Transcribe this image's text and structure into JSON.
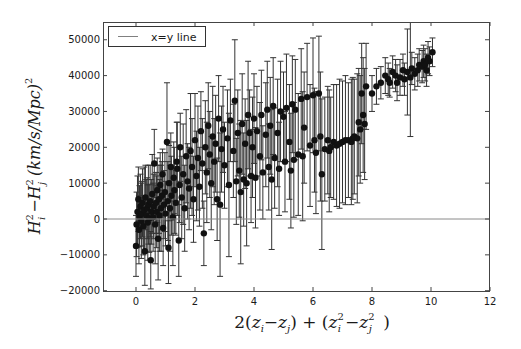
{
  "chart_data": {
    "type": "scatter",
    "title": "",
    "xlabel": "2(z_i - z_j) + (z_i^2 - z_j^2)",
    "ylabel": "H_i^2 - H_j^2 (km/s/Mpc)^2",
    "xlim": [
      -1.1,
      12
    ],
    "ylim": [
      -20000,
      55000
    ],
    "xticks": [
      0,
      2,
      4,
      6,
      8,
      10,
      12
    ],
    "yticks": [
      -20000,
      -10000,
      0,
      10000,
      20000,
      30000,
      40000,
      50000
    ],
    "xtick_labels": [
      "0",
      "2",
      "4",
      "6",
      "8",
      "10",
      "12"
    ],
    "ytick_labels": [
      "−20000",
      "−10000",
      "0",
      "10000",
      "20000",
      "30000",
      "40000",
      "50000"
    ],
    "grid": false,
    "legend": {
      "position": "upper left",
      "entries": [
        {
          "label": "x=y line",
          "style": "line",
          "color": "#808080"
        }
      ]
    },
    "reference_line": {
      "name": "x=y line",
      "y": 0,
      "color": "#8a8a8a"
    },
    "marker_color": "#111111",
    "errorbar_color": "#333333",
    "series": [
      {
        "name": "data",
        "points": [
          [
            0.0,
            -7500,
            8500
          ],
          [
            0.02,
            -1500,
            9000
          ],
          [
            0.05,
            2000,
            10000
          ],
          [
            0.08,
            5500,
            9000
          ],
          [
            0.1,
            -3000,
            9500
          ],
          [
            0.12,
            800,
            8500
          ],
          [
            0.15,
            3500,
            9000
          ],
          [
            0.18,
            -500,
            10500
          ],
          [
            0.2,
            1500,
            9000
          ],
          [
            0.22,
            4500,
            9500
          ],
          [
            0.25,
            -2000,
            8000
          ],
          [
            0.28,
            2500,
            12000
          ],
          [
            0.3,
            -9000,
            9500
          ],
          [
            0.32,
            6000,
            9000
          ],
          [
            0.35,
            1000,
            10000
          ],
          [
            0.38,
            3000,
            8500
          ],
          [
            0.4,
            -1000,
            10500
          ],
          [
            0.42,
            4000,
            11000
          ],
          [
            0.45,
            200,
            9500
          ],
          [
            0.48,
            5000,
            10000
          ],
          [
            0.5,
            -11500,
            8000
          ],
          [
            0.52,
            2000,
            9000
          ],
          [
            0.55,
            7000,
            11000
          ],
          [
            0.58,
            500,
            9500
          ],
          [
            0.6,
            3500,
            9000
          ],
          [
            0.62,
            15500,
            9500
          ],
          [
            0.65,
            -1500,
            11000
          ],
          [
            0.68,
            4500,
            8500
          ],
          [
            0.7,
            2000,
            10000
          ],
          [
            0.72,
            8000,
            9000
          ],
          [
            0.75,
            -5500,
            11500
          ],
          [
            0.78,
            5500,
            9500
          ],
          [
            0.8,
            1000,
            10000
          ],
          [
            0.82,
            9500,
            9000
          ],
          [
            0.85,
            3000,
            12000
          ],
          [
            0.88,
            6500,
            9500
          ],
          [
            0.9,
            12500,
            7000
          ],
          [
            0.92,
            -2500,
            10500
          ],
          [
            0.95,
            4000,
            9500
          ],
          [
            0.98,
            7500,
            11000
          ],
          [
            1.0,
            1500,
            9000
          ],
          [
            1.05,
            21500,
            16500
          ],
          [
            1.08,
            5000,
            11000
          ],
          [
            1.1,
            -8000,
            10000
          ],
          [
            1.12,
            10000,
            10500
          ],
          [
            1.15,
            3000,
            12000
          ],
          [
            1.18,
            14500,
            9500
          ],
          [
            1.2,
            6500,
            11000
          ],
          [
            1.25,
            500,
            13500
          ],
          [
            1.28,
            11500,
            10000
          ],
          [
            1.3,
            8000,
            12000
          ],
          [
            1.35,
            4500,
            9000
          ],
          [
            1.38,
            16000,
            11000
          ],
          [
            1.4,
            14000,
            13000
          ],
          [
            1.45,
            -6000,
            10000
          ],
          [
            1.48,
            9500,
            10500
          ],
          [
            1.5,
            20000,
            9500
          ],
          [
            1.55,
            6000,
            11500
          ],
          [
            1.6,
            12500,
            14000
          ],
          [
            1.65,
            3000,
            12000
          ],
          [
            1.7,
            17500,
            13000
          ],
          [
            1.75,
            10500,
            10500
          ],
          [
            1.8,
            8500,
            11500
          ],
          [
            1.85,
            19000,
            16000
          ],
          [
            1.9,
            14500,
            13500
          ],
          [
            1.95,
            5500,
            12000
          ],
          [
            2.0,
            22000,
            13000
          ],
          [
            2.05,
            12000,
            12500
          ],
          [
            2.1,
            17000,
            14500
          ],
          [
            2.15,
            9000,
            11000
          ],
          [
            2.2,
            24500,
            11000
          ],
          [
            2.25,
            15500,
            12500
          ],
          [
            2.3,
            -4000,
            9000
          ],
          [
            2.35,
            20000,
            13000
          ],
          [
            2.4,
            13000,
            14000
          ],
          [
            2.45,
            26000,
            12000
          ],
          [
            2.5,
            18000,
            12000
          ],
          [
            2.55,
            10000,
            13000
          ],
          [
            2.6,
            23000,
            14000
          ],
          [
            2.65,
            16000,
            12000
          ],
          [
            2.7,
            21000,
            13500
          ],
          [
            2.75,
            5500,
            11500
          ],
          [
            2.8,
            28000,
            12000
          ],
          [
            2.85,
            4000,
            20000
          ],
          [
            2.9,
            19500,
            12000
          ],
          [
            2.95,
            25000,
            12000
          ],
          [
            3.0,
            15000,
            12000
          ],
          [
            3.1,
            22500,
            13500
          ],
          [
            3.15,
            9500,
            20000
          ],
          [
            3.2,
            27500,
            11500
          ],
          [
            3.3,
            19000,
            13000
          ],
          [
            3.35,
            33000,
            17000
          ],
          [
            3.4,
            10500,
            12000
          ],
          [
            3.45,
            24000,
            12000
          ],
          [
            3.5,
            13500,
            13000
          ],
          [
            3.55,
            7500,
            20000
          ],
          [
            3.6,
            26500,
            14000
          ],
          [
            3.65,
            11000,
            13000
          ],
          [
            3.7,
            21000,
            12500
          ],
          [
            3.75,
            10000,
            17500
          ],
          [
            3.8,
            29000,
            15000
          ],
          [
            3.85,
            24000,
            12000
          ],
          [
            3.9,
            12000,
            13000
          ],
          [
            3.95,
            20000,
            14000
          ],
          [
            4.0,
            28000,
            12500
          ],
          [
            4.05,
            11500,
            14000
          ],
          [
            4.1,
            24500,
            12500
          ],
          [
            4.2,
            17500,
            15000
          ],
          [
            4.25,
            29000,
            12500
          ],
          [
            4.3,
            13000,
            13000
          ],
          [
            4.4,
            23500,
            14500
          ],
          [
            4.45,
            30500,
            13500
          ],
          [
            4.5,
            14500,
            12000
          ],
          [
            4.55,
            26000,
            13500
          ],
          [
            4.6,
            11000,
            19500
          ],
          [
            4.65,
            31500,
            13500
          ],
          [
            4.7,
            17000,
            14000
          ],
          [
            4.8,
            24000,
            15000
          ],
          [
            4.85,
            14000,
            13000
          ],
          [
            4.9,
            30000,
            14000
          ],
          [
            5.0,
            28500,
            12500
          ],
          [
            5.05,
            16000,
            14000
          ],
          [
            5.1,
            31000,
            15000
          ],
          [
            5.2,
            21500,
            16000
          ],
          [
            5.25,
            13500,
            16000
          ],
          [
            5.3,
            32000,
            13500
          ],
          [
            5.35,
            16500,
            16000
          ],
          [
            5.4,
            30500,
            14000
          ],
          [
            5.5,
            18000,
            17000
          ],
          [
            5.6,
            33500,
            14000
          ],
          [
            5.65,
            17500,
            18000
          ],
          [
            5.7,
            25500,
            15500
          ],
          [
            5.8,
            34000,
            15000
          ],
          [
            5.9,
            20500,
            17000
          ],
          [
            6.0,
            34500,
            16000
          ],
          [
            6.05,
            22000,
            14500
          ],
          [
            6.1,
            18500,
            17000
          ],
          [
            6.2,
            35000,
            16000
          ],
          [
            6.25,
            23000,
            18000
          ],
          [
            6.3,
            12500,
            21000
          ],
          [
            6.4,
            19500,
            14500
          ],
          [
            6.5,
            22000,
            15000
          ],
          [
            6.55,
            19000,
            17000
          ],
          [
            6.6,
            20000,
            14000
          ],
          [
            6.7,
            21500,
            16000
          ],
          [
            6.8,
            20500,
            17000
          ],
          [
            6.9,
            21000,
            18000
          ],
          [
            7.0,
            21500,
            17000
          ],
          [
            7.1,
            22000,
            18000
          ],
          [
            7.2,
            22000,
            16000
          ],
          [
            7.3,
            21500,
            17500
          ],
          [
            7.35,
            22500,
            17000
          ],
          [
            7.4,
            23000,
            16000
          ],
          [
            7.5,
            22500,
            18000
          ],
          [
            7.55,
            27000,
            15000
          ],
          [
            7.6,
            25000,
            15000
          ],
          [
            7.65,
            35000,
            14000
          ],
          [
            7.7,
            29000,
            16000
          ],
          [
            7.75,
            26500,
            15500
          ],
          [
            7.8,
            37000,
            12000
          ],
          [
            8.0,
            35000,
            5000
          ],
          [
            8.15,
            37000,
            5000
          ],
          [
            8.3,
            38000,
            4500
          ],
          [
            8.45,
            40000,
            5000
          ],
          [
            8.55,
            39000,
            4500
          ],
          [
            8.6,
            38000,
            4000
          ],
          [
            8.7,
            41000,
            4500
          ],
          [
            8.8,
            40000,
            4500
          ],
          [
            8.85,
            38000,
            5000
          ],
          [
            8.95,
            39500,
            5000
          ],
          [
            9.05,
            41500,
            4500
          ],
          [
            9.1,
            39000,
            4500
          ],
          [
            9.2,
            41000,
            12000
          ],
          [
            9.3,
            39500,
            16500
          ],
          [
            9.35,
            42000,
            4500
          ],
          [
            9.45,
            40500,
            4500
          ],
          [
            9.55,
            41500,
            4500
          ],
          [
            9.6,
            43000,
            4500
          ],
          [
            9.7,
            42500,
            4500
          ],
          [
            9.75,
            44000,
            4500
          ],
          [
            9.8,
            43000,
            4500
          ],
          [
            9.85,
            41500,
            4500
          ],
          [
            9.9,
            45000,
            4500
          ],
          [
            9.95,
            44000,
            4000
          ],
          [
            10.05,
            46500,
            4000
          ]
        ]
      }
    ]
  }
}
